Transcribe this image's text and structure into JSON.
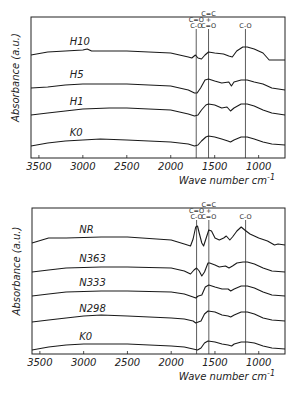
{
  "chart_data": [
    {
      "type": "line",
      "title": "",
      "xlabel": "Wave number cm-1",
      "xlabel_main": "Wave number cm",
      "xlabel_sup": "-1",
      "ylabel": "Absorbance (a.u.)",
      "xlim": [
        3590,
        700
      ],
      "x_reversed": true,
      "xticks": [
        3500,
        3000,
        2500,
        2000,
        1500,
        1000
      ],
      "grid": false,
      "legend": "inline labels",
      "frame": {
        "left": 31,
        "top": 17,
        "right": 285,
        "bottom": 158
      },
      "peak_markers": [
        {
          "wn": 1710,
          "label_lines": [
            "C=O",
            "C-O"
          ]
        },
        {
          "wn": 1570,
          "label_lines": [
            "C=C",
            "+",
            "C=O"
          ]
        },
        {
          "wn": 1150,
          "label_lines": [
            "C-O"
          ]
        }
      ],
      "series": [
        {
          "name": "H10",
          "baseline_y": 55,
          "label_wn": 3150,
          "points": [
            [
              3590,
              0
            ],
            [
              3400,
              -3
            ],
            [
              3200,
              -4
            ],
            [
              3000,
              -5
            ],
            [
              2950,
              -6
            ],
            [
              2900,
              -4
            ],
            [
              2500,
              -4
            ],
            [
              2000,
              -2
            ],
            [
              1800,
              2
            ],
            [
              1760,
              3
            ],
            [
              1720,
              0
            ],
            [
              1690,
              3
            ],
            [
              1650,
              4
            ],
            [
              1610,
              0
            ],
            [
              1570,
              -3
            ],
            [
              1500,
              -2
            ],
            [
              1400,
              -1
            ],
            [
              1340,
              1
            ],
            [
              1300,
              2
            ],
            [
              1250,
              -4
            ],
            [
              1180,
              -8
            ],
            [
              1130,
              -8
            ],
            [
              1050,
              -6
            ],
            [
              950,
              -2
            ],
            [
              880,
              5
            ],
            [
              700,
              5
            ]
          ]
        },
        {
          "name": "H5",
          "baseline_y": 88,
          "label_wn": 3150,
          "points": [
            [
              3590,
              0
            ],
            [
              3400,
              -1
            ],
            [
              3200,
              -3
            ],
            [
              3000,
              -4
            ],
            [
              2500,
              -4
            ],
            [
              2000,
              -2
            ],
            [
              1800,
              2
            ],
            [
              1730,
              5
            ],
            [
              1700,
              5
            ],
            [
              1660,
              0
            ],
            [
              1610,
              -8
            ],
            [
              1570,
              -9
            ],
            [
              1500,
              -7
            ],
            [
              1420,
              -5
            ],
            [
              1340,
              -6
            ],
            [
              1310,
              -2
            ],
            [
              1280,
              -6
            ],
            [
              1200,
              -8
            ],
            [
              1130,
              -8
            ],
            [
              1050,
              -6
            ],
            [
              950,
              -4
            ],
            [
              850,
              0
            ],
            [
              700,
              2
            ]
          ]
        },
        {
          "name": "H1",
          "baseline_y": 115,
          "label_wn": 3150,
          "points": [
            [
              3590,
              0
            ],
            [
              3400,
              -2
            ],
            [
              3200,
              -4
            ],
            [
              3000,
              -6
            ],
            [
              2700,
              -7
            ],
            [
              2500,
              -7
            ],
            [
              2000,
              -5
            ],
            [
              1800,
              -1
            ],
            [
              1730,
              1
            ],
            [
              1690,
              0
            ],
            [
              1650,
              -5
            ],
            [
              1600,
              -10
            ],
            [
              1570,
              -11
            ],
            [
              1500,
              -10
            ],
            [
              1420,
              -7
            ],
            [
              1360,
              -8
            ],
            [
              1320,
              -4
            ],
            [
              1280,
              -7
            ],
            [
              1200,
              -11
            ],
            [
              1130,
              -11
            ],
            [
              1050,
              -9
            ],
            [
              950,
              -5
            ],
            [
              850,
              -2
            ],
            [
              700,
              0
            ]
          ]
        },
        {
          "name": "K0",
          "baseline_y": 146,
          "label_wn": 3150,
          "points": [
            [
              3590,
              0
            ],
            [
              3400,
              -3
            ],
            [
              3200,
              -5
            ],
            [
              3000,
              -6
            ],
            [
              2800,
              -7
            ],
            [
              2500,
              -6
            ],
            [
              2000,
              -4
            ],
            [
              1800,
              -2
            ],
            [
              1730,
              0
            ],
            [
              1690,
              -1
            ],
            [
              1650,
              -5
            ],
            [
              1600,
              -9
            ],
            [
              1570,
              -10
            ],
            [
              1500,
              -9
            ],
            [
              1420,
              -7
            ],
            [
              1350,
              -5
            ],
            [
              1320,
              -4
            ],
            [
              1280,
              -6
            ],
            [
              1200,
              -9
            ],
            [
              1130,
              -9
            ],
            [
              1050,
              -7
            ],
            [
              950,
              -4
            ],
            [
              850,
              -2
            ],
            [
              700,
              -1
            ]
          ]
        }
      ]
    },
    {
      "type": "line",
      "title": "",
      "xlabel": "Wave number cm-1",
      "xlabel_main": "Wave number cm",
      "xlabel_sup": "-1",
      "ylabel": "Absorbance (a.u.)",
      "xlim": [
        3590,
        700
      ],
      "x_reversed": true,
      "xticks": [
        3500,
        3000,
        2500,
        2000,
        1500,
        1000
      ],
      "grid": false,
      "legend": "inline labels",
      "frame": {
        "left": 32,
        "top": 208,
        "right": 285,
        "bottom": 354
      },
      "peak_markers": [
        {
          "wn": 1710,
          "label_lines": [
            "C=O",
            "C-O"
          ]
        },
        {
          "wn": 1570,
          "label_lines": [
            "C=C",
            "+",
            "C=O"
          ]
        },
        {
          "wn": 1150,
          "label_lines": [
            "C-O"
          ]
        }
      ],
      "series": [
        {
          "name": "NR",
          "baseline_y": 243,
          "label_wn": 3050,
          "points": [
            [
              3590,
              0
            ],
            [
              3400,
              -5
            ],
            [
              3200,
              -5
            ],
            [
              2800,
              -6
            ],
            [
              2500,
              -6
            ],
            [
              2000,
              -3
            ],
            [
              1850,
              1
            ],
            [
              1780,
              3
            ],
            [
              1750,
              -4
            ],
            [
              1720,
              -16
            ],
            [
              1700,
              -17
            ],
            [
              1680,
              -10
            ],
            [
              1650,
              0
            ],
            [
              1630,
              3
            ],
            [
              1600,
              -5
            ],
            [
              1570,
              -13
            ],
            [
              1540,
              -12
            ],
            [
              1500,
              -5
            ],
            [
              1450,
              -3
            ],
            [
              1400,
              -5
            ],
            [
              1370,
              -7
            ],
            [
              1330,
              -3
            ],
            [
              1300,
              -6
            ],
            [
              1250,
              -12
            ],
            [
              1200,
              -16
            ],
            [
              1160,
              -13
            ],
            [
              1100,
              -9
            ],
            [
              1000,
              -5
            ],
            [
              900,
              -2
            ],
            [
              820,
              2
            ],
            [
              780,
              1
            ],
            [
              700,
              2
            ]
          ]
        },
        {
          "name": "N363",
          "baseline_y": 272,
          "label_wn": 3050,
          "points": [
            [
              3590,
              0
            ],
            [
              3400,
              -2
            ],
            [
              3200,
              -4
            ],
            [
              2800,
              -5
            ],
            [
              2500,
              -5
            ],
            [
              2000,
              -4
            ],
            [
              1850,
              -1
            ],
            [
              1780,
              2
            ],
            [
              1740,
              -2
            ],
            [
              1710,
              -4
            ],
            [
              1680,
              -1
            ],
            [
              1650,
              4
            ],
            [
              1620,
              0
            ],
            [
              1580,
              -9
            ],
            [
              1560,
              -9
            ],
            [
              1500,
              -7
            ],
            [
              1450,
              -5
            ],
            [
              1380,
              -6
            ],
            [
              1340,
              -4
            ],
            [
              1300,
              -6
            ],
            [
              1250,
              -9
            ],
            [
              1180,
              -10
            ],
            [
              1130,
              -10
            ],
            [
              1050,
              -8
            ],
            [
              950,
              -4
            ],
            [
              850,
              -1
            ],
            [
              700,
              0
            ]
          ]
        },
        {
          "name": "N333",
          "baseline_y": 296,
          "label_wn": 3050,
          "points": [
            [
              3590,
              0
            ],
            [
              3400,
              -2
            ],
            [
              3200,
              -4
            ],
            [
              2800,
              -5
            ],
            [
              2500,
              -5
            ],
            [
              2000,
              -4
            ],
            [
              1850,
              -2
            ],
            [
              1750,
              1
            ],
            [
              1720,
              2
            ],
            [
              1690,
              0
            ],
            [
              1650,
              -1
            ],
            [
              1610,
              -9
            ],
            [
              1570,
              -11
            ],
            [
              1500,
              -9
            ],
            [
              1420,
              -7
            ],
            [
              1350,
              -7
            ],
            [
              1320,
              -5
            ],
            [
              1280,
              -7
            ],
            [
              1200,
              -10
            ],
            [
              1130,
              -10
            ],
            [
              1050,
              -8
            ],
            [
              950,
              -4
            ],
            [
              850,
              -1
            ],
            [
              700,
              0
            ]
          ]
        },
        {
          "name": "N298",
          "baseline_y": 322,
          "label_wn": 3050,
          "points": [
            [
              3590,
              0
            ],
            [
              3400,
              -2
            ],
            [
              3200,
              -4
            ],
            [
              3000,
              -6
            ],
            [
              2800,
              -7
            ],
            [
              2500,
              -6
            ],
            [
              2000,
              -4
            ],
            [
              1850,
              -3
            ],
            [
              1750,
              -1
            ],
            [
              1720,
              1
            ],
            [
              1690,
              0
            ],
            [
              1660,
              -1
            ],
            [
              1620,
              -8
            ],
            [
              1580,
              -11
            ],
            [
              1500,
              -10
            ],
            [
              1420,
              -7
            ],
            [
              1350,
              -6
            ],
            [
              1320,
              -5
            ],
            [
              1280,
              -7
            ],
            [
              1200,
              -10
            ],
            [
              1130,
              -10
            ],
            [
              1050,
              -8
            ],
            [
              950,
              -4
            ],
            [
              850,
              -2
            ],
            [
              700,
              -1
            ]
          ]
        },
        {
          "name": "K0",
          "baseline_y": 350,
          "label_wn": 3050,
          "points": [
            [
              3590,
              0
            ],
            [
              3400,
              -3
            ],
            [
              3200,
              -5
            ],
            [
              3000,
              -6
            ],
            [
              2800,
              -6
            ],
            [
              2500,
              -6
            ],
            [
              2000,
              -4
            ],
            [
              1850,
              -3
            ],
            [
              1750,
              -1
            ],
            [
              1700,
              0
            ],
            [
              1660,
              -2
            ],
            [
              1620,
              -7
            ],
            [
              1580,
              -9
            ],
            [
              1500,
              -8
            ],
            [
              1420,
              -6
            ],
            [
              1350,
              -5
            ],
            [
              1310,
              -4
            ],
            [
              1280,
              -6
            ],
            [
              1200,
              -8
            ],
            [
              1130,
              -8
            ],
            [
              1050,
              -7
            ],
            [
              950,
              -4
            ],
            [
              850,
              -2
            ],
            [
              700,
              -1
            ]
          ]
        }
      ]
    }
  ]
}
